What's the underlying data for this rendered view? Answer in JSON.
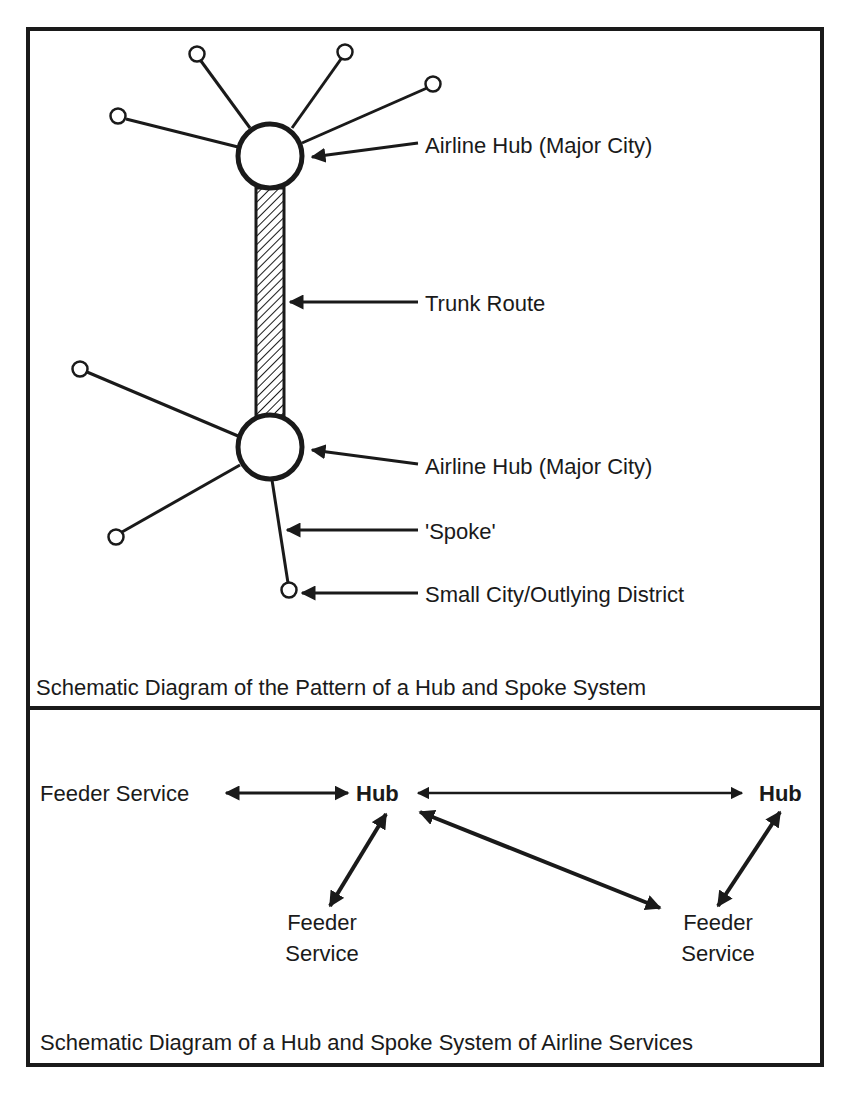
{
  "top_panel": {
    "labels": {
      "hub_top": "Airline Hub (Major City)",
      "trunk": "Trunk Route",
      "hub_bottom": "Airline Hub (Major City)",
      "spoke": "'Spoke'",
      "small_city": "Small City/Outlying District"
    },
    "caption": "Schematic Diagram of the Pattern of a Hub and Spoke System"
  },
  "bottom_panel": {
    "feeder_left": "Feeder Service",
    "hub_left": "Hub",
    "hub_right": "Hub",
    "feeder_mid_line1": "Feeder",
    "feeder_mid_line2": "Service",
    "feeder_right_line1": "Feeder",
    "feeder_right_line2": "Service",
    "caption": "Schematic Diagram of a Hub and Spoke System of Airline Services"
  },
  "colors": {
    "ink": "#1a1a1a",
    "background": "#ffffff"
  }
}
